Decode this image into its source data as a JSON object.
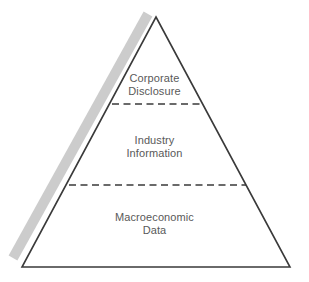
{
  "diagram": {
    "type": "pyramid",
    "background_color": "#ffffff",
    "outline_color": "#3a3a3a",
    "divider_color": "#3a3a3a",
    "shadow_color": "#cccccc",
    "text_color": "#595959",
    "apex": {
      "x": 156,
      "y": 17
    },
    "base_left": {
      "x": 22,
      "y": 267
    },
    "base_right": {
      "x": 290,
      "y": 267
    },
    "tiers": [
      {
        "name": "corporate-disclosure",
        "lines": [
          "Corporate",
          "Disclosure"
        ],
        "divider_y": 104,
        "divider_x_start": 112,
        "divider_x_end": 204
      },
      {
        "name": "industry-information",
        "lines": [
          "Industry",
          "Information"
        ],
        "divider_y": 185,
        "divider_x_start": 69,
        "divider_x_end": 246
      },
      {
        "name": "macroeconomic-data",
        "lines": [
          "Macroeconomic",
          "Data"
        ],
        "divider_y": null,
        "divider_x_start": null,
        "divider_x_end": null
      }
    ],
    "shadow_stripe": {
      "name": "drop-shadow-stripe",
      "top": {
        "x": 148,
        "y": 14
      },
      "bottom": {
        "x": 13,
        "y": 258
      },
      "width": 10
    }
  }
}
